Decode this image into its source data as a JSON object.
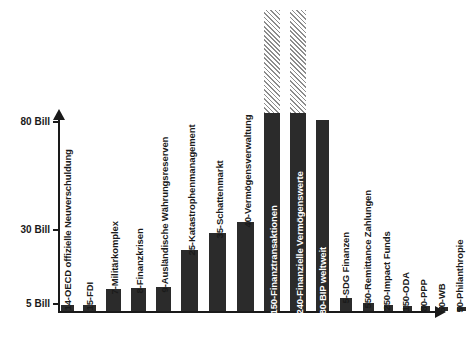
{
  "chart_data": {
    "type": "bar",
    "title": "",
    "subtitle": "",
    "xlabel": "",
    "ylabel": "",
    "ylim": [
      0,
      300
    ],
    "grid": false,
    "legend": "none",
    "y_ticks": [
      {
        "label": "5 Bill",
        "value": 5
      },
      {
        "label": "30 Bill",
        "value": 30
      },
      {
        "label": "80 Bill",
        "value": 80
      }
    ],
    "note": "Bars whose value exceeds the plotted axis range are drawn hatched/clipped at the top of the frame.",
    "categories": [
      "14-OECD offizielle Neuverschuldung",
      "15-FDI",
      "7-Militärkomplex",
      "8-Finanzkrisen",
      "9-Ausländische Währungsreserven",
      "25-Katastrophenmanagement",
      "35-Schattenmarkt",
      "40-Vermögensverwaltung",
      "150-Finanztransaktionen",
      "240-Finanzielle Vermögenswerte",
      "80-BIP weltweit",
      "5-SDG Finanzen",
      "550-Remittance Zahlungen",
      "250-Impact Funds",
      "150-ODA",
      "80-PPP",
      "50-WB",
      "50-Philanthropie"
    ],
    "values": [
      14,
      15,
      7,
      8,
      9,
      25,
      35,
      40,
      150,
      240,
      80,
      5,
      550,
      250,
      150,
      80,
      50,
      50
    ],
    "bars": [
      {
        "label": "14-OECD offizielle Neuverschuldung",
        "value": 14,
        "x": 61,
        "width": 13,
        "top": 305,
        "style": "solid",
        "label_on_bar": false
      },
      {
        "label": "15-FDI",
        "value": 15,
        "x": 83,
        "width": 13,
        "top": 305,
        "style": "solid",
        "label_on_bar": false
      },
      {
        "label": "7-Militärkomplex",
        "value": 7,
        "x": 106,
        "width": 15,
        "top": 289,
        "style": "solid",
        "label_on_bar": false
      },
      {
        "label": "8-Finanzkrisen",
        "value": 8,
        "x": 131,
        "width": 15,
        "top": 288,
        "style": "solid",
        "label_on_bar": false
      },
      {
        "label": "9-Ausländische Währungsreserven",
        "value": 9,
        "x": 156,
        "width": 15,
        "top": 287,
        "style": "solid",
        "label_on_bar": false
      },
      {
        "label": "25-Katastrophenmanagement",
        "value": 25,
        "x": 181,
        "width": 17,
        "top": 250,
        "style": "solid",
        "label_on_bar": false
      },
      {
        "label": "35-Schattenmarkt",
        "value": 35,
        "x": 209,
        "width": 17,
        "top": 233,
        "style": "solid",
        "label_on_bar": false
      },
      {
        "label": "40-Vermögensverwaltung",
        "value": 40,
        "x": 237,
        "width": 17,
        "top": 222,
        "style": "solid",
        "label_on_bar": false
      },
      {
        "label": "150-Finanztransaktionen",
        "value": 150,
        "x": 264,
        "width": 16,
        "top": 113,
        "style": "solid",
        "label_on_bar": true
      },
      {
        "label": "240-Finanzielle Vermögenswerte",
        "value": 240,
        "x": 290,
        "width": 16,
        "top": 113,
        "style": "solid",
        "label_on_bar": true
      },
      {
        "label": "80-BIP weltweit",
        "value": 80,
        "x": 316,
        "width": 13,
        "top": 120,
        "style": "solid",
        "label_on_bar": true
      },
      {
        "label": "5-SDG Finanzen",
        "value": 5,
        "x": 340,
        "width": 12,
        "top": 298,
        "style": "solid",
        "label_on_bar": false
      },
      {
        "label": "550-Remittance Zahlungen",
        "value": 550,
        "x": 363,
        "width": 11,
        "top": 303,
        "style": "solid",
        "label_on_bar": false
      },
      {
        "label": "250-Impact Funds",
        "value": 250,
        "x": 384,
        "width": 9,
        "top": 305,
        "style": "solid",
        "label_on_bar": false
      },
      {
        "label": "150-ODA",
        "value": 150,
        "x": 403,
        "width": 9,
        "top": 306,
        "style": "solid",
        "label_on_bar": false
      },
      {
        "label": "80-PPP",
        "value": 80,
        "x": 421,
        "width": 9,
        "top": 306,
        "style": "solid",
        "label_on_bar": false
      },
      {
        "label": "50-WB",
        "value": 50,
        "x": 439,
        "width": 9,
        "top": 307,
        "style": "solid",
        "label_on_bar": false
      },
      {
        "label": "50-Philanthropie",
        "value": 50,
        "x": 457,
        "width": 9,
        "top": 307,
        "style": "solid",
        "label_on_bar": false
      }
    ],
    "overflow_bars": [
      {
        "label": "150-Finanztransaktionen",
        "x": 264,
        "width": 16,
        "top": 10,
        "height": 103
      },
      {
        "label": "240-Finanzielle Vermögenswerte",
        "x": 290,
        "width": 16,
        "top": 10,
        "height": 103
      }
    ],
    "colors": {
      "bar": "#2b2b2b",
      "bar_overflow_hatch": "#8c8c8c",
      "axis": "#1a1a1a",
      "background": "#ffffff",
      "label_on_bar": "#ffffff",
      "label_off_bar": "#1a1a1a"
    }
  }
}
